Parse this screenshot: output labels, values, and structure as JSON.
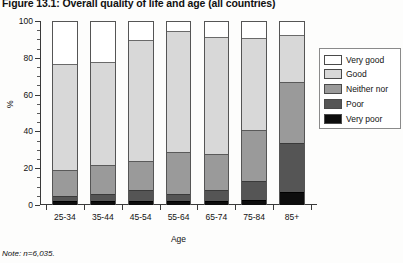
{
  "figure": {
    "title": "Figure 13.1: Overall quality of life and age (all countries)",
    "note": "Note: n=6,035."
  },
  "axes": {
    "ylabel": "%",
    "xlabel": "Age",
    "yticks": [
      "0",
      "20",
      "40",
      "60",
      "80",
      "100"
    ]
  },
  "legend": {
    "items": [
      {
        "label": "Very good",
        "color": "#ffffff"
      },
      {
        "label": "Good",
        "color": "#d8d8d8"
      },
      {
        "label": "Neither nor",
        "color": "#9a9a9a"
      },
      {
        "label": "Poor",
        "color": "#555555"
      },
      {
        "label": "Very poor",
        "color": "#0d0d0d"
      }
    ]
  },
  "chart_data": {
    "type": "bar",
    "subtype": "stacked-vertical",
    "title": "Figure 13.1: Overall quality of life and age (all countries)",
    "xlabel": "Age",
    "ylabel": "%",
    "ylim": [
      0,
      100
    ],
    "ytick_interval": 20,
    "yminor_interval": 5,
    "grid": false,
    "legend_position": "right",
    "note": "Note: n=6,035.",
    "categories": [
      "25-34",
      "35-44",
      "45-54",
      "55-64",
      "65-74",
      "75-84",
      "85+"
    ],
    "series": [
      {
        "name": "Very poor",
        "color": "#0d0d0d",
        "values": [
          2,
          2,
          2,
          2,
          2,
          3,
          7
        ]
      },
      {
        "name": "Poor",
        "color": "#555555",
        "values": [
          3,
          4,
          6,
          4,
          6,
          10,
          27
        ]
      },
      {
        "name": "Neither nor",
        "color": "#9a9a9a",
        "values": [
          14,
          16,
          16,
          23,
          20,
          28,
          33
        ]
      },
      {
        "name": "Good",
        "color": "#d8d8d8",
        "values": [
          58,
          56,
          66,
          66,
          64,
          50,
          26
        ]
      },
      {
        "name": "Very good",
        "color": "#ffffff",
        "values": [
          23,
          22,
          10,
          5,
          8,
          9,
          7
        ]
      }
    ]
  }
}
